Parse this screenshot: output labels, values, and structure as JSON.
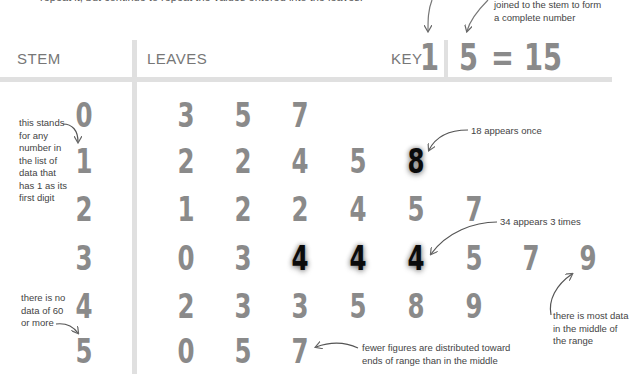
{
  "intro_text": "repeat it, but continue to repeat the values entered into the leaves.",
  "header": {
    "stem_label": "STEM",
    "leaves_label": "LEAVES",
    "key_label": "KEY",
    "key_stem": "1",
    "key_leaf": "5",
    "key_equals": "=",
    "key_value": "15"
  },
  "annotations": {
    "key_leaf_note_line1": "joined to the stem to form",
    "key_leaf_note_line2": "a complete number",
    "stem_note": [
      "this stands",
      "for any",
      "number in",
      "the list of",
      "data that",
      "has 1 as its",
      "first digit"
    ],
    "no_data_note": [
      "there is no",
      "data of 60",
      "or more"
    ],
    "appears_once": "18 appears once",
    "appears_three": "34 appears 3 times",
    "most_data": [
      "there is most data",
      "in the middle of",
      "the range"
    ],
    "fewer_figures": [
      "fewer figures are distributed toward",
      "ends of range than in the middle"
    ]
  },
  "rows": [
    {
      "stem": "0",
      "leaves": [
        "3",
        "5",
        "7"
      ]
    },
    {
      "stem": "1",
      "leaves": [
        "2",
        "2",
        "4",
        "5",
        "8"
      ]
    },
    {
      "stem": "2",
      "leaves": [
        "1",
        "2",
        "2",
        "4",
        "5",
        "7"
      ]
    },
    {
      "stem": "3",
      "leaves": [
        "0",
        "3",
        "4",
        "4",
        "4",
        "5",
        "7",
        "9"
      ]
    },
    {
      "stem": "4",
      "leaves": [
        "2",
        "3",
        "3",
        "5",
        "8",
        "9"
      ]
    },
    {
      "stem": "5",
      "leaves": [
        "0",
        "5",
        "7"
      ]
    }
  ],
  "colors": {
    "digit_gray": "#8a8a8a",
    "highlight_black": "#0b0b0b",
    "rule_gray": "#e0e0e0"
  }
}
